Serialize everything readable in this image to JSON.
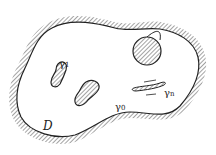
{
  "diagram": {
    "labels": {
      "domain": "D",
      "gamma0": "γ",
      "gamma0_sub": "0",
      "gamma1": "γ",
      "gamma1_sub": "1",
      "gamman": "γ",
      "gamman_sub": "n"
    },
    "colors": {
      "stroke": "#222222",
      "hatch": "#555555",
      "background": "#ffffff"
    }
  }
}
